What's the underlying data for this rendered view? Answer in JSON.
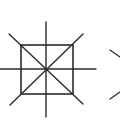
{
  "diagram": {
    "title": "",
    "stroke_color": "#2b2b2b",
    "background": "#ffffff",
    "figure": {
      "name": "square-with-radiating-lines",
      "square": {
        "x": 21,
        "y": 45,
        "width": 52,
        "height": 49
      },
      "center": {
        "x": 46,
        "y": 69
      },
      "lines": [
        {
          "name": "vertical-axis",
          "x1": 46,
          "y1": 22,
          "x2": 46,
          "y2": 117
        },
        {
          "name": "horizontal-axis",
          "x1": 0,
          "y1": 69,
          "x2": 96,
          "y2": 69
        },
        {
          "name": "diagonal-down",
          "x1": 9,
          "y1": 34,
          "x2": 83,
          "y2": 104
        },
        {
          "name": "diagonal-up",
          "x1": 10,
          "y1": 105,
          "x2": 83,
          "y2": 34
        }
      ]
    },
    "next_figure_partial": {
      "name": "chevron-partial",
      "upper": {
        "x1": 110,
        "y1": 50,
        "x2": 120,
        "y2": 57
      },
      "lower": {
        "x1": 110,
        "y1": 99,
        "x2": 120,
        "y2": 92
      }
    }
  }
}
